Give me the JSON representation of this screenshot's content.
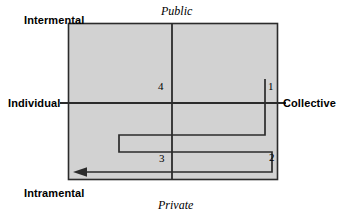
{
  "diagram": {
    "type": "conceptual-matrix",
    "title": "",
    "axes": {
      "vertical": {
        "top_label": "Intermental",
        "bottom_label": "Intramental"
      },
      "horizontal": {
        "left_label": "Individual",
        "right_label": "Collective"
      },
      "secondary_vertical": {
        "top_label": "Public",
        "bottom_label": "Private"
      }
    },
    "plot_area": {
      "fill_color": "#d2d2d2",
      "border_color": "#2b2b2b",
      "x": 68,
      "y": 23,
      "width": 210,
      "height": 157
    },
    "axis_lines": {
      "horizontal_y": 103,
      "vertical_x": 172,
      "color": "#2b2b2b"
    },
    "path": {
      "name": "zigzag-trajectory",
      "color": "#2b2b2b",
      "arrow_direction": "left",
      "points": [
        {
          "x": 265,
          "y": 79
        },
        {
          "x": 265,
          "y": 135
        },
        {
          "x": 119,
          "y": 135
        },
        {
          "x": 119,
          "y": 152
        },
        {
          "x": 272,
          "y": 152
        },
        {
          "x": 272,
          "y": 172
        },
        {
          "x": 75,
          "y": 172
        }
      ]
    },
    "step_labels": [
      {
        "id": "1",
        "label": "1",
        "x": 268,
        "y": 80
      },
      {
        "id": "2",
        "label": "2",
        "x": 269,
        "y": 151
      },
      {
        "id": "3",
        "label": "3",
        "x": 159,
        "y": 152
      },
      {
        "id": "4",
        "label": "4",
        "x": 158,
        "y": 80
      }
    ]
  }
}
